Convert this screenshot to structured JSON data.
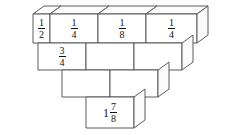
{
  "figure": {
    "title": "",
    "type": "fraction-block-pyramid",
    "rows": [
      {
        "row_index": 1,
        "block_count": 4,
        "blocks": [
          {
            "label": "1/2",
            "whole": "",
            "numerator": "1",
            "denominator": "2"
          },
          {
            "label": "1/4",
            "whole": "",
            "numerator": "1",
            "denominator": "4"
          },
          {
            "label": "1/8",
            "whole": "",
            "numerator": "1",
            "denominator": "8"
          },
          {
            "label": "1/4",
            "whole": "",
            "numerator": "1",
            "denominator": "4"
          }
        ]
      },
      {
        "row_index": 2,
        "block_count": 3,
        "blocks": [
          {
            "label": "3/4",
            "whole": "",
            "numerator": "3",
            "denominator": "4"
          },
          {
            "label": "",
            "whole": "",
            "numerator": "",
            "denominator": ""
          },
          {
            "label": "",
            "whole": "",
            "numerator": "",
            "denominator": ""
          }
        ]
      },
      {
        "row_index": 3,
        "block_count": 2,
        "blocks": [
          {
            "label": "",
            "whole": "",
            "numerator": "",
            "denominator": ""
          },
          {
            "label": "",
            "whole": "",
            "numerator": "",
            "denominator": ""
          }
        ]
      },
      {
        "row_index": 4,
        "block_count": 1,
        "blocks": [
          {
            "label": "1 7/8",
            "whole": "1",
            "numerator": "7",
            "denominator": "8"
          }
        ]
      }
    ],
    "colors": {
      "stroke": "#4b4b4b",
      "face": "#ffffff",
      "text": "#111111",
      "background": "#ffffff"
    }
  }
}
